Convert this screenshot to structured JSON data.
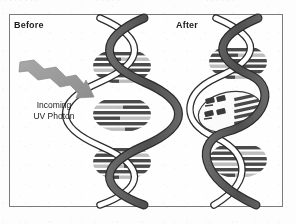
{
  "figure": {
    "type": "scanned-textbook-diagram",
    "background_color": "#fdfdfd",
    "frame_color": "#7b7b7b"
  },
  "top_strip": {
    "fragment_1": "· · · · · · ·",
    "fragment_2": "· · · · ·",
    "fragment_3": "· · · · · ·"
  },
  "panels": {
    "left": {
      "label": "Before",
      "state": "undamaged-dna"
    },
    "right": {
      "label": "After",
      "state": "damaged-dna-thymine-dimer"
    }
  },
  "annotation": {
    "photon_line_1": "Incoming",
    "photon_line_2": "UV Photon"
  },
  "colors": {
    "backbone_dark": "#5a5a5a",
    "backbone_outline": "#2b2b2b",
    "backbone_light": "#ffffff",
    "rung_dark": "#4a4a4a",
    "rung_light": "#bdbdbd",
    "photon_arrow": "#9a9a9a",
    "text": "#1c1c1c"
  }
}
